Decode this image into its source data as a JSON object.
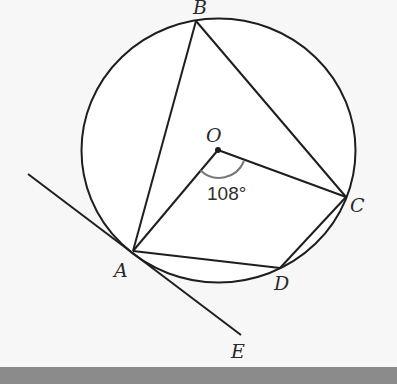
{
  "diagram": {
    "type": "circle-geometry",
    "circle": {
      "center": "O",
      "cx": 218.5,
      "cy": 150.5,
      "rx": 137,
      "ry": 132
    },
    "points": {
      "B": {
        "x": 196,
        "y": 21,
        "label": "B",
        "label_x": 193,
        "label_y": 14
      },
      "O": {
        "x": 218,
        "y": 150,
        "label": "O",
        "label_x": 206,
        "label_y": 142
      },
      "C": {
        "x": 346,
        "y": 197,
        "label": "C",
        "label_x": 350,
        "label_y": 212
      },
      "A": {
        "x": 133,
        "y": 251,
        "label": "A",
        "label_x": 114,
        "label_y": 277
      },
      "D": {
        "x": 280,
        "y": 268,
        "label": "D",
        "label_x": 274,
        "label_y": 290
      },
      "E": {
        "x": 241,
        "y": 335,
        "label": "E",
        "label_x": 231,
        "label_y": 358
      }
    },
    "segments": [
      [
        "A",
        "B"
      ],
      [
        "B",
        "C"
      ],
      [
        "O",
        "A"
      ],
      [
        "O",
        "C"
      ],
      [
        "A",
        "D"
      ],
      [
        "D",
        "C"
      ]
    ],
    "tangent": {
      "from": {
        "x": 28,
        "y": 174
      },
      "to": "E",
      "touches": "A"
    },
    "angle": {
      "vertex": "O",
      "between": [
        "A",
        "C"
      ],
      "value": "108°",
      "label_x": 207,
      "label_y": 200
    }
  },
  "colors": {
    "stroke": "#1e1e1e",
    "arc": "#7a7a7a",
    "background": "#f7f7f7",
    "footer": "#8b8b8b"
  }
}
